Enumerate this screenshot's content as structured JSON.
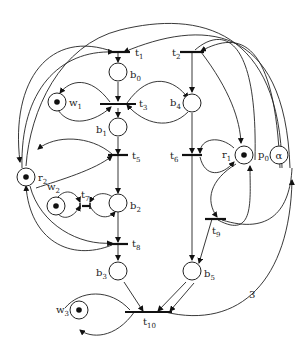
{
  "diagram": {
    "type": "petri-net",
    "places": [
      {
        "id": "b0",
        "label": "b",
        "sub": "0",
        "tokens": 0
      },
      {
        "id": "b1",
        "label": "b",
        "sub": "1",
        "tokens": 0
      },
      {
        "id": "b2",
        "label": "b",
        "sub": "2",
        "tokens": 0
      },
      {
        "id": "b3",
        "label": "b",
        "sub": "3",
        "tokens": 0
      },
      {
        "id": "b4",
        "label": "b",
        "sub": "4",
        "tokens": 0
      },
      {
        "id": "b5",
        "label": "b",
        "sub": "5",
        "tokens": 0
      },
      {
        "id": "w1",
        "label": "w",
        "sub": "1",
        "tokens": 1
      },
      {
        "id": "w2",
        "label": "w",
        "sub": "2",
        "tokens": 1
      },
      {
        "id": "w3",
        "label": "w",
        "sub": "3",
        "tokens": 1
      },
      {
        "id": "r1",
        "label": "r",
        "sub": "1",
        "tokens": 1
      },
      {
        "id": "r2",
        "label": "r",
        "sub": "2",
        "tokens": 1
      },
      {
        "id": "p0",
        "label": "p",
        "sub": "0",
        "tokens": 0,
        "content": "α"
      }
    ],
    "transitions": [
      {
        "id": "t1",
        "label": "t",
        "sub": "1"
      },
      {
        "id": "t2",
        "label": "t",
        "sub": "2"
      },
      {
        "id": "t3",
        "label": "t",
        "sub": "3"
      },
      {
        "id": "t5",
        "label": "t",
        "sub": "5"
      },
      {
        "id": "t6",
        "label": "t",
        "sub": "6"
      },
      {
        "id": "t7",
        "label": "t",
        "sub": "7"
      },
      {
        "id": "t8",
        "label": "t",
        "sub": "8"
      },
      {
        "id": "t9",
        "label": "t",
        "sub": "9"
      },
      {
        "id": "t10",
        "label": "t",
        "sub": "10"
      }
    ],
    "arc_weight_label": "3"
  }
}
